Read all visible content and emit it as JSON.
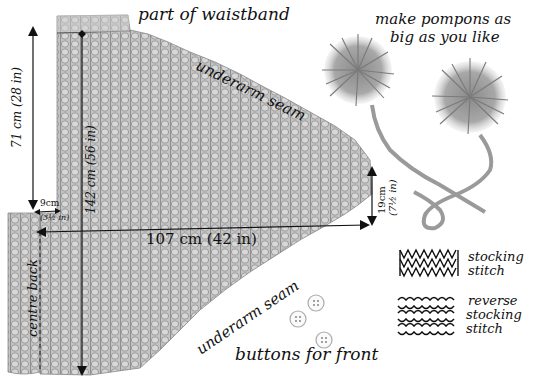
{
  "diagram": {
    "labels": {
      "waistband": "part of waistband",
      "underarm_top": "underarm seam",
      "underarm_bottom": "underarm seam",
      "pompons_line1": "make pompons as",
      "pompons_line2": "big as you like",
      "buttons": "buttons for front",
      "centre_back": "centre back",
      "stocking_line1": "stocking",
      "stocking_line2": "stitch",
      "reverse_line1": "reverse",
      "reverse_line2": "stocking",
      "reverse_line3": "stitch"
    },
    "dimensions": {
      "height_outer": "71 cm (28 in)",
      "height_inner": "142 cm (56 in)",
      "width": "107 cm (42 in)",
      "step_cm": "9cm",
      "step_in": "(3½ in)",
      "cuff_cm": "19cm",
      "cuff_in": "(7½ in)"
    },
    "legend": [
      {
        "pattern": "stocking-stitch",
        "label": "stocking stitch"
      },
      {
        "pattern": "reverse-stocking-stitch",
        "label": "reverse stocking stitch"
      }
    ],
    "colors": {
      "knit_fill": "#b8b8b8",
      "knit_rib": "#8c8c8c",
      "ink": "#111111",
      "background": "#ffffff"
    }
  }
}
